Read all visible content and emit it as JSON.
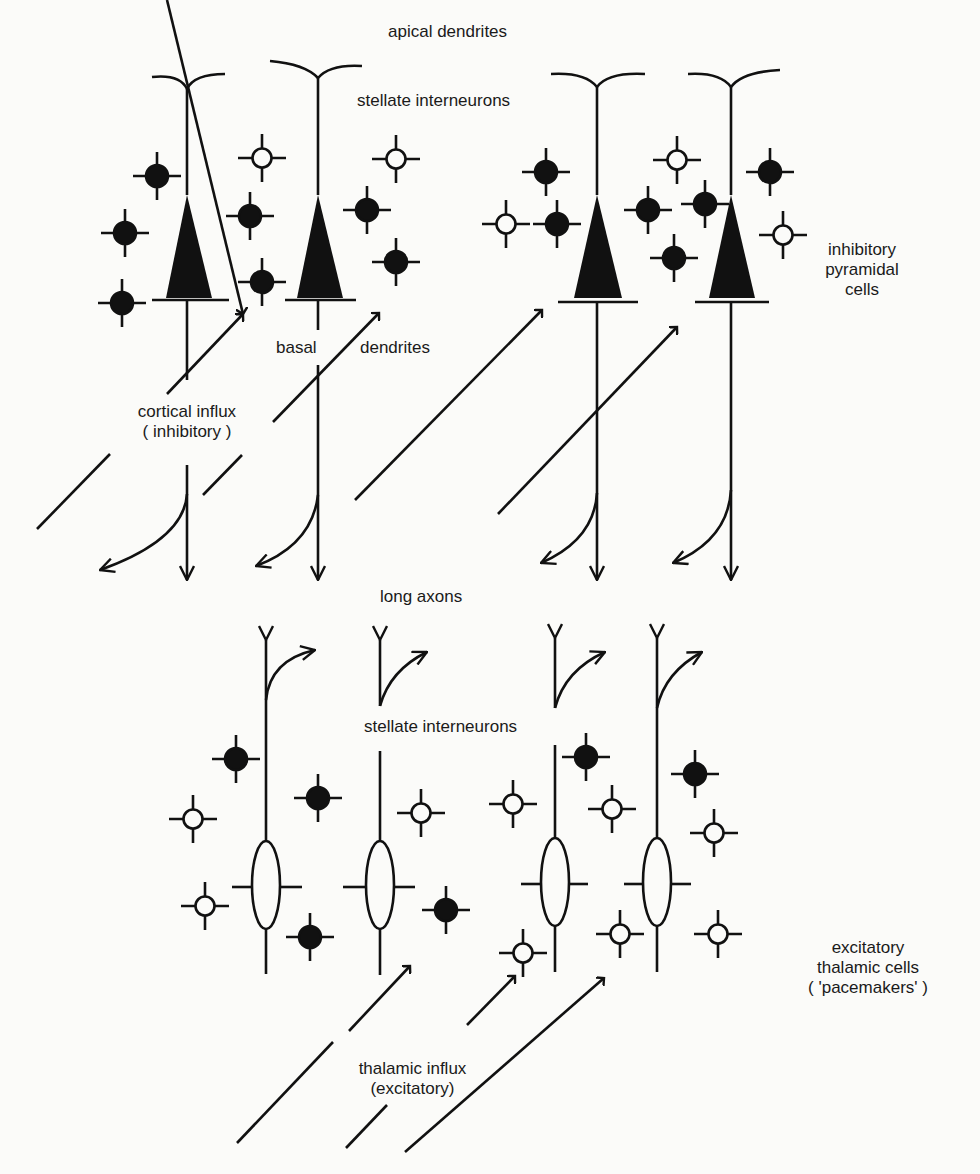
{
  "labels": {
    "apical_dendrites": "apical dendrites",
    "stellate_top": "stellate interneurons",
    "inhibitory_pyramidal": [
      "inhibitory",
      "pyramidal",
      "cells"
    ],
    "basal": "basal",
    "dendrites": "dendrites",
    "cortical_influx": [
      "cortical influx",
      "( inhibitory )"
    ],
    "long_axons": "long axons",
    "stellate_bottom": "stellate interneurons",
    "excitatory_thalamic": [
      "excitatory",
      "thalamic cells",
      "( 'pacemakers' )"
    ],
    "thalamic_influx": [
      "thalamic influx",
      "(excitatory)"
    ]
  },
  "colors": {
    "ink": "#111111",
    "background": "#fbfbf9"
  },
  "pyramidal_cells": [
    {
      "x": 187
    },
    {
      "x": 318
    },
    {
      "x": 597
    },
    {
      "x": 731
    }
  ],
  "thalamic_cells": [
    {
      "x": 266
    },
    {
      "x": 380
    },
    {
      "x": 555
    },
    {
      "x": 685
    }
  ],
  "stellate_top": [
    {
      "x": 157,
      "y": 176,
      "filled": true
    },
    {
      "x": 125,
      "y": 233,
      "filled": true
    },
    {
      "x": 122,
      "y": 303,
      "filled": true
    },
    {
      "x": 262,
      "y": 158,
      "filled": false
    },
    {
      "x": 250,
      "y": 216,
      "filled": true
    },
    {
      "x": 262,
      "y": 282,
      "filled": true
    },
    {
      "x": 396,
      "y": 159,
      "filled": false
    },
    {
      "x": 367,
      "y": 210,
      "filled": true
    },
    {
      "x": 396,
      "y": 262,
      "filled": true
    },
    {
      "x": 546,
      "y": 172,
      "filled": true
    },
    {
      "x": 506,
      "y": 224,
      "filled": false
    },
    {
      "x": 557,
      "y": 224,
      "filled": true
    },
    {
      "x": 677,
      "y": 160,
      "filled": false
    },
    {
      "x": 648,
      "y": 210,
      "filled": true
    },
    {
      "x": 705,
      "y": 204,
      "filled": true
    },
    {
      "x": 674,
      "y": 258,
      "filled": true
    },
    {
      "x": 770,
      "y": 172,
      "filled": true
    },
    {
      "x": 783,
      "y": 235,
      "filled": false
    }
  ],
  "stellate_bottom": [
    {
      "x": 236,
      "y": 759,
      "filled": true
    },
    {
      "x": 193,
      "y": 819,
      "filled": false
    },
    {
      "x": 205,
      "y": 906,
      "filled": false
    },
    {
      "x": 318,
      "y": 798,
      "filled": true
    },
    {
      "x": 310,
      "y": 937,
      "filled": true
    },
    {
      "x": 421,
      "y": 813,
      "filled": false
    },
    {
      "x": 446,
      "y": 910,
      "filled": true
    },
    {
      "x": 513,
      "y": 804,
      "filled": false
    },
    {
      "x": 586,
      "y": 757,
      "filled": true
    },
    {
      "x": 612,
      "y": 809,
      "filled": false
    },
    {
      "x": 695,
      "y": 774,
      "filled": true
    },
    {
      "x": 714,
      "y": 833,
      "filled": false
    },
    {
      "x": 523,
      "y": 953,
      "filled": false
    },
    {
      "x": 620,
      "y": 934,
      "filled": false
    },
    {
      "x": 718,
      "y": 934,
      "filled": false
    }
  ]
}
